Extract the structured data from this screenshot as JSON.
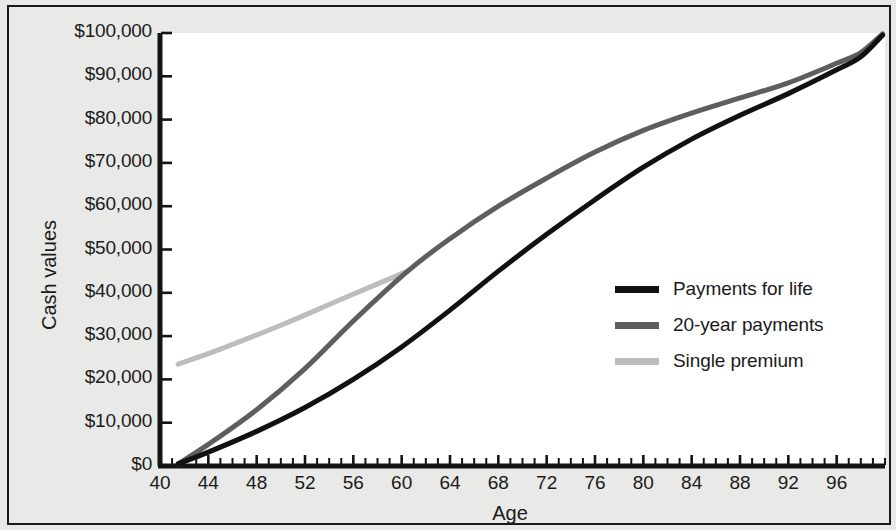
{
  "chart_data": {
    "type": "line",
    "title": "",
    "xlabel": "Age",
    "ylabel": "Cash values",
    "xlim": [
      40,
      100
    ],
    "ylim": [
      0,
      100000
    ],
    "grid": false,
    "legend_position": "center-right",
    "x_ticks_major": [
      40,
      44,
      48,
      52,
      56,
      60,
      64,
      68,
      72,
      76,
      80,
      84,
      88,
      92,
      96
    ],
    "x_tick_labels": [
      "40",
      "44",
      "48",
      "52",
      "56",
      "60",
      "64",
      "68",
      "72",
      "76",
      "80",
      "84",
      "88",
      "92",
      "96"
    ],
    "x_tick_minor_step": 1,
    "y_ticks": [
      0,
      10000,
      20000,
      30000,
      40000,
      50000,
      60000,
      70000,
      80000,
      90000,
      100000
    ],
    "y_tick_labels": [
      "$0",
      "$10,000",
      "$20,000",
      "$30,000",
      "$40,000",
      "$50,000",
      "$60,000",
      "$70,000",
      "$80,000",
      "$90,000",
      "$100,000"
    ],
    "series": [
      {
        "name": "Payments for life",
        "color": "#111111",
        "width": 5,
        "x": [
          41.5,
          44,
          48,
          52,
          56,
          60,
          64,
          68,
          72,
          76,
          80,
          84,
          88,
          92,
          96,
          98,
          99.8
        ],
        "values": [
          500,
          3200,
          8000,
          13500,
          20000,
          27500,
          36000,
          45000,
          53500,
          61500,
          69000,
          75500,
          81000,
          86000,
          91500,
          94500,
          99500
        ]
      },
      {
        "name": "20-year payments",
        "color": "#5e5e5e",
        "width": 5,
        "x": [
          41.5,
          44,
          48,
          52,
          56,
          60.5,
          64,
          68,
          72,
          76,
          80,
          84,
          88,
          92,
          96,
          98,
          99.8
        ],
        "values": [
          500,
          5000,
          13000,
          22500,
          33500,
          45000,
          52500,
          60000,
          66500,
          72500,
          77500,
          81500,
          85000,
          88500,
          93000,
          95500,
          99800
        ]
      },
      {
        "name": "Single premium",
        "color": "#bdbdbd",
        "width": 5,
        "x": [
          41.5,
          45,
          50,
          55,
          60.5
        ],
        "values": [
          23500,
          27000,
          32500,
          38500,
          45000
        ]
      }
    ],
    "annotations": [
      {
        "text": "Single premium merges into 20-year payments curve",
        "x": 60.5,
        "y": 45000
      }
    ]
  },
  "legend": {
    "items": [
      {
        "label": "Payments for life",
        "color": "#111111"
      },
      {
        "label": "20-year payments",
        "color": "#5e5e5e"
      },
      {
        "label": "Single premium",
        "color": "#bdbdbd"
      }
    ]
  },
  "axes": {
    "y_title": "Cash values",
    "x_title": "Age"
  },
  "colors": {
    "background": "#e9e9e7",
    "plot_background": "#ffffff",
    "axis": "#1a1a1a",
    "text": "#1b1b1b"
  }
}
